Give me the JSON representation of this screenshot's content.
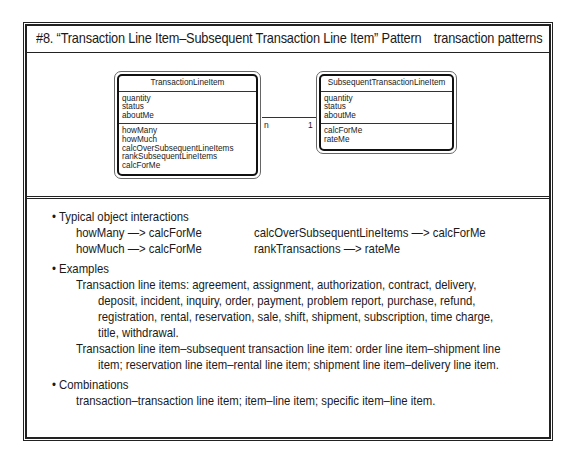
{
  "header": {
    "title": "#8. “Transaction Line Item–Subsequent Transaction Line Item” Pattern",
    "category": "transaction patterns"
  },
  "diagram": {
    "classes": [
      {
        "name": "TransactionLineItem",
        "attributes": [
          "quantity",
          "status",
          "aboutMe"
        ],
        "services": [
          "howMany",
          "howMuch",
          "calcOverSubsequentLineItems",
          "rankSubsequentLineItems",
          "calcForMe"
        ]
      },
      {
        "name": "SubsequentTransactionLineItem",
        "attributes": [
          "quantity",
          "status",
          "aboutMe"
        ],
        "services": [
          "calcForMe",
          "rateMe"
        ]
      }
    ],
    "connection": {
      "from_multiplicity": "n",
      "to_multiplicity": "1"
    }
  },
  "sections": {
    "interactions": {
      "heading": "• Typical object interactions",
      "items": [
        "howMany —> calcForMe",
        "howMuch —> calcForMe",
        "calcOverSubsequentLineItems —> calcForMe",
        "rankTransactions —> rateMe"
      ]
    },
    "examples": {
      "heading": "• Examples",
      "lines": [
        "Transaction line items: agreement, assignment, authorization, contract, delivery,",
        "deposit, incident, inquiry, order, payment, problem report, purchase, refund,",
        "registration, rental, reservation, sale, shift, shipment, subscription, time charge,",
        "title, withdrawal.",
        "Transaction line item–subsequent transaction line item: order line item–shipment line",
        "item; reservation line item–rental line item; shipment line item–delivery line item."
      ]
    },
    "combinations": {
      "heading": "• Combinations",
      "text": "transaction–transaction line item; item–line item; specific item–line item."
    }
  }
}
